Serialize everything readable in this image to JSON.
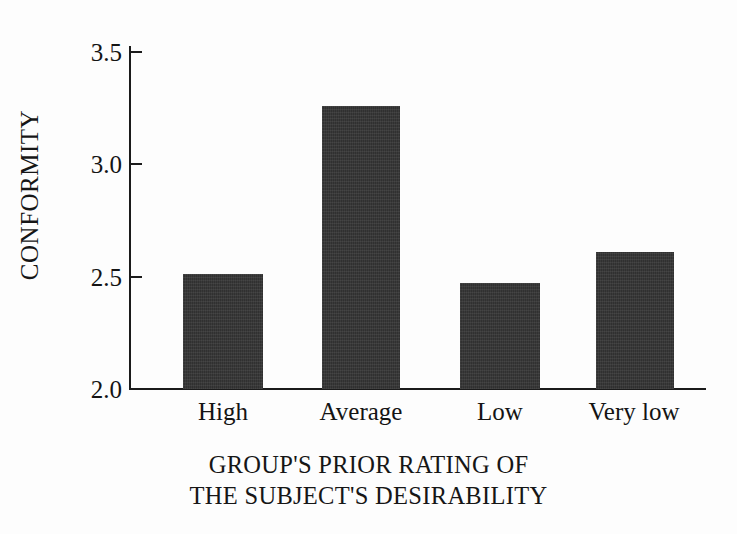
{
  "chart_data": {
    "type": "bar",
    "title": "",
    "subtitle": "",
    "categories": [
      "High",
      "Average",
      "Low",
      "Very low"
    ],
    "values": [
      2.51,
      3.26,
      2.47,
      2.61
    ],
    "series": [
      {
        "name": "Conformity",
        "values": [
          2.51,
          3.26,
          2.47,
          2.61
        ]
      }
    ],
    "xlabel_lines": [
      "GROUP'S PRIOR RATING OF",
      "THE SUBJECT'S DESIRABILITY"
    ],
    "xlabel": "GROUP'S PRIOR RATING OF THE SUBJECT'S DESIRABILITY",
    "ylabel": "CONFORMITY",
    "ylim": [
      2.0,
      3.5
    ],
    "yticks": [
      "2.0",
      "2.5",
      "3.0",
      "3.5"
    ],
    "ytick_values": [
      2.0,
      2.5,
      3.0,
      3.5
    ],
    "grid": false,
    "legend": false,
    "legend_position": "none",
    "bar_color": "#353535",
    "axis_color": "#1b1b1b",
    "background_color": "#fdfdfd",
    "text_color": "#141414"
  },
  "axes": {
    "y_title": "CONFORMITY",
    "y_ticks": [
      {
        "label": "3.5",
        "value": 3.5
      },
      {
        "label": "3.0",
        "value": 3.0
      },
      {
        "label": "2.5",
        "value": 2.5
      },
      {
        "label": "2.0",
        "value": 2.0
      }
    ],
    "x_ticks": [
      {
        "label": "High",
        "value": 2.51
      },
      {
        "label": "Average",
        "value": 3.26
      },
      {
        "label": "Low",
        "value": 2.47
      },
      {
        "label": "Very low",
        "value": 2.61
      }
    ],
    "x_title_line1": "GROUP'S PRIOR RATING OF",
    "x_title_line2": "THE SUBJECT'S DESIRABILITY"
  }
}
